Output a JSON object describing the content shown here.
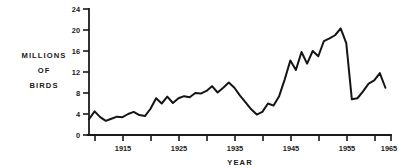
{
  "chart_data": {
    "type": "line",
    "title": "",
    "xlabel": "YEAR",
    "ylabel": "MILLIONS OF BIRDS",
    "ylabel_lines": [
      "MILLIONS",
      "OF",
      "BIRDS"
    ],
    "xlim": [
      1911,
      1965
    ],
    "ylim": [
      0,
      24
    ],
    "grid": false,
    "legend": null,
    "yticks": [
      0,
      4,
      8,
      12,
      16,
      20,
      24
    ],
    "ytick_labels": [
      "0",
      "4",
      "8",
      "12",
      "16",
      "20",
      "24"
    ],
    "xticks": [
      1915,
      1920,
      1925,
      1930,
      1935,
      1940,
      1945,
      1950,
      1955,
      1960,
      1965
    ],
    "xtick_labels": [
      "1915",
      "",
      "1925",
      "",
      "1935",
      "",
      "1945",
      "",
      "1955",
      "",
      "1965"
    ],
    "line_color": "#151515",
    "x": [
      1911,
      1912,
      1913,
      1914,
      1915,
      1916,
      1917,
      1918,
      1919,
      1920,
      1921,
      1922,
      1923,
      1924,
      1925,
      1926,
      1927,
      1928,
      1929,
      1930,
      1931,
      1932,
      1933,
      1934,
      1935,
      1936,
      1937,
      1938,
      1939,
      1940,
      1941,
      1942,
      1943,
      1944,
      1945,
      1946,
      1947,
      1948,
      1949,
      1950,
      1951,
      1952,
      1953,
      1954,
      1955,
      1956,
      1957,
      1958,
      1959,
      1960,
      1961,
      1962,
      1963,
      1964
    ],
    "values": [
      3.0,
      4.5,
      3.4,
      2.7,
      3.1,
      3.5,
      3.4,
      4.0,
      4.4,
      3.8,
      3.6,
      5.0,
      7.0,
      6.0,
      7.3,
      6.1,
      7.0,
      7.4,
      7.2,
      8.0,
      7.9,
      8.4,
      9.3,
      8.1,
      9.0,
      10.0,
      9.0,
      7.5,
      6.2,
      4.9,
      3.9,
      4.4,
      6.0,
      5.6,
      7.4,
      10.6,
      14.2,
      12.4,
      15.8,
      13.6,
      16.0,
      15.0,
      17.9,
      18.4,
      19.0,
      20.3,
      17.5,
      6.8,
      7.0,
      8.3,
      9.8,
      10.4,
      11.8,
      9.0
    ],
    "units": "millions of birds"
  },
  "axes": {
    "y_axis_name": "millions-of-birds-axis",
    "x_axis_name": "year-axis"
  }
}
